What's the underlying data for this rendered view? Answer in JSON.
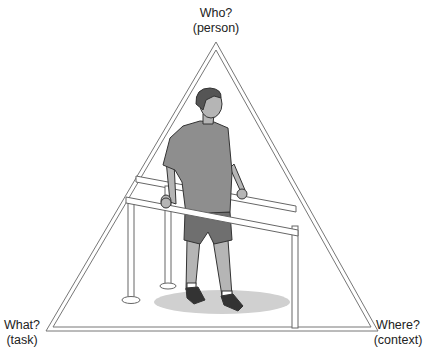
{
  "diagram": {
    "type": "triangle-framework",
    "vertices": [
      {
        "id": "top",
        "question": "Who?",
        "aspect": "(person)"
      },
      {
        "id": "bottom-left",
        "question": "What?",
        "aspect": "(task)"
      },
      {
        "id": "bottom-right",
        "question": "Where?",
        "aspect": "(context)"
      }
    ],
    "illustration": "Man standing between parallel bars, holding both rails",
    "colors": {
      "frame_stroke": "#777777",
      "shirt": "#8e8e8e",
      "shorts": "#6f6f6f",
      "skin": "#b5b5b5",
      "shadow": "#cfcfcf"
    }
  }
}
